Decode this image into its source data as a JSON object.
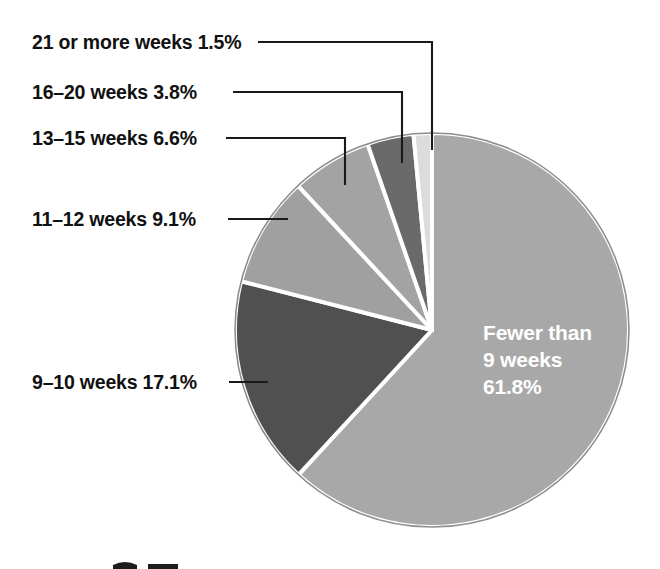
{
  "figure": {
    "background_color": "#ffffff",
    "center_label": {
      "line1": "Fewer than",
      "line2": "9 weeks",
      "line3": "61.8%"
    }
  },
  "callouts": [
    {
      "id": "21-or-more-weeks",
      "text": "21 or more weeks 1.5%"
    },
    {
      "id": "16-20-weeks",
      "text": "16–20 weeks 3.8%"
    },
    {
      "id": "13-15-weeks",
      "text": "13–15 weeks 6.6%"
    },
    {
      "id": "11-12-weeks",
      "text": "11–12 weeks 9.1%"
    },
    {
      "id": "9-10-weeks",
      "text": "9–10 weeks 17.1%"
    }
  ],
  "chart_data": {
    "type": "pie",
    "title": "",
    "xlabel": "",
    "ylabel": "",
    "grid": false,
    "legend_position": "callout-labels-left",
    "start_angle_deg": 0,
    "direction": "clockwise",
    "categories": [
      "Fewer than 9 weeks",
      "9–10 weeks",
      "11–12 weeks",
      "13–15 weeks",
      "16–20 weeks",
      "21 or more weeks"
    ],
    "values": [
      61.8,
      17.1,
      9.1,
      6.6,
      3.8,
      1.5
    ],
    "value_labels": [
      "61.8%",
      "17.1%",
      "9.1%",
      "6.6%",
      "3.8%",
      "1.5%"
    ],
    "units": "percent",
    "total": 99.9,
    "slice_colors": [
      "#a8a8a8",
      "#505050",
      "#a0a0a0",
      "#a3a3a3",
      "#6a6a6a",
      "#dcdcdc"
    ],
    "slice_label_colors": [
      "#ffffff",
      "#111111",
      "#111111",
      "#111111",
      "#111111",
      "#111111"
    ]
  },
  "geometry": {
    "center_x": 432,
    "center_y": 330,
    "radius": 197
  }
}
